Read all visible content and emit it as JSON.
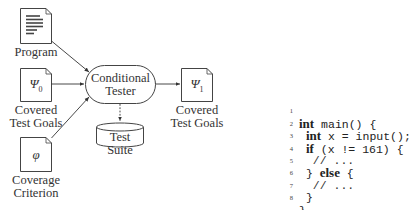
{
  "diagram": {
    "nodes": {
      "program": {
        "label": "Program",
        "icon": "text-document-icon"
      },
      "covered_in": {
        "symbol": "Ψ",
        "subscript": "0",
        "label_line1": "Covered",
        "label_line2": "Test Goals"
      },
      "criterion": {
        "symbol": "φ",
        "label_line1": "Coverage",
        "label_line2": "Criterion"
      },
      "tester": {
        "label_line1": "Conditional",
        "label_line2": "Tester"
      },
      "suite": {
        "label": "Test Suite"
      },
      "covered_out": {
        "symbol": "Ψ",
        "subscript": "1",
        "label_line1": "Covered",
        "label_line2": "Test Goals"
      }
    },
    "edges": [
      {
        "from": "program",
        "to": "tester",
        "style": "solid"
      },
      {
        "from": "covered_in",
        "to": "tester",
        "style": "solid"
      },
      {
        "from": "criterion",
        "to": "tester",
        "style": "solid"
      },
      {
        "from": "tester",
        "to": "covered_out",
        "style": "solid"
      },
      {
        "from": "tester",
        "to": "suite",
        "style": "dashed"
      }
    ]
  },
  "code": {
    "lines": [
      {
        "n": "1",
        "kw": "int",
        "rest": " main() {",
        "indent": ""
      },
      {
        "n": "2",
        "kw": "int",
        "rest": " x = input();",
        "indent": " "
      },
      {
        "n": "3",
        "kw": "if",
        "rest": " (x != 161) {",
        "indent": " "
      },
      {
        "n": "4",
        "kw": "",
        "rest": "// ...",
        "indent": "  "
      },
      {
        "n": "5",
        "kw_pre": "} ",
        "kw": "else",
        "rest": " {",
        "indent": " "
      },
      {
        "n": "6",
        "kw": "",
        "rest": "// ...",
        "indent": "  "
      },
      {
        "n": "7",
        "kw": "",
        "rest": "}",
        "indent": " "
      },
      {
        "n": "8",
        "kw": "",
        "rest": "}",
        "indent": ""
      }
    ]
  }
}
